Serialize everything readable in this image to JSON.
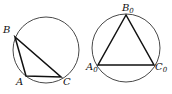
{
  "diagrams": [
    {
      "name": "scalene-triangle-inscribed",
      "circle": {
        "cx": 46,
        "cy": 50,
        "r": 33
      },
      "vertices": [
        {
          "label": "B",
          "sub": "",
          "x": 15,
          "y": 37,
          "lx": 3,
          "ly": 33
        },
        {
          "label": "A",
          "sub": "",
          "x": 26,
          "y": 76,
          "lx": 16,
          "ly": 85
        },
        {
          "label": "C",
          "sub": "",
          "x": 61,
          "y": 77,
          "lx": 63,
          "ly": 85
        }
      ]
    },
    {
      "name": "equilateral-triangle-inscribed",
      "circle": {
        "cx": 126,
        "cy": 48,
        "r": 34
      },
      "vertices": [
        {
          "label": "B",
          "sub": "0",
          "x": 126,
          "y": 15,
          "lx": 122,
          "ly": 11
        },
        {
          "label": "A",
          "sub": "0",
          "x": 98,
          "y": 65,
          "lx": 86,
          "ly": 70
        },
        {
          "label": "C",
          "sub": "0",
          "x": 154,
          "y": 65,
          "lx": 155,
          "ly": 70
        }
      ]
    }
  ]
}
